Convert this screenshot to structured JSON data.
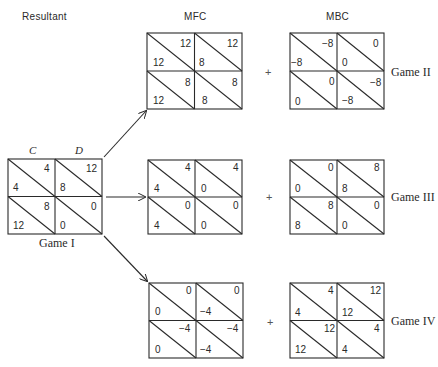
{
  "headers": {
    "resultant": "Resultant",
    "mfc": "MFC",
    "mbc": "MBC"
  },
  "strategy_labels": {
    "c": "C",
    "d": "D"
  },
  "plus_sign": "+",
  "games": {
    "game1": {
      "label": "Game I",
      "cells": [
        {
          "row": "C",
          "col": "C",
          "top_right": "4",
          "bottom_left": "4"
        },
        {
          "row": "C",
          "col": "D",
          "top_right": "12",
          "bottom_left": "8"
        },
        {
          "row": "D",
          "col": "C",
          "top_right": "8",
          "bottom_left": "12"
        },
        {
          "row": "D",
          "col": "D",
          "top_right": "0",
          "bottom_left": "0"
        }
      ]
    },
    "game2": {
      "label": "Game II",
      "mfc": [
        {
          "top_right": "12",
          "bottom_left": "12"
        },
        {
          "top_right": "12",
          "bottom_left": "8"
        },
        {
          "top_right": "8",
          "bottom_left": "12"
        },
        {
          "top_right": "8",
          "bottom_left": "8"
        }
      ],
      "mbc": [
        {
          "top_right": "−8",
          "bottom_left": "−8"
        },
        {
          "top_right": "0",
          "bottom_left": "0"
        },
        {
          "top_right": "0",
          "bottom_left": "0"
        },
        {
          "top_right": "−8",
          "bottom_left": "−8"
        }
      ]
    },
    "game3": {
      "label": "Game III",
      "mfc": [
        {
          "top_right": "4",
          "bottom_left": "4"
        },
        {
          "top_right": "4",
          "bottom_left": "0"
        },
        {
          "top_right": "0",
          "bottom_left": "4"
        },
        {
          "top_right": "0",
          "bottom_left": "0"
        }
      ],
      "mbc": [
        {
          "top_right": "0",
          "bottom_left": "0"
        },
        {
          "top_right": "8",
          "bottom_left": "8"
        },
        {
          "top_right": "8",
          "bottom_left": "8"
        },
        {
          "top_right": "0",
          "bottom_left": "0"
        }
      ]
    },
    "game4": {
      "label": "Game IV",
      "mfc": [
        {
          "top_right": "0",
          "bottom_left": "0"
        },
        {
          "top_right": "0",
          "bottom_left": "−4"
        },
        {
          "top_right": "−4",
          "bottom_left": "0"
        },
        {
          "top_right": "−4",
          "bottom_left": "−4"
        }
      ],
      "mbc": [
        {
          "top_right": "4",
          "bottom_left": "4"
        },
        {
          "top_right": "12",
          "bottom_left": "12"
        },
        {
          "top_right": "12",
          "bottom_left": "12"
        },
        {
          "top_right": "4",
          "bottom_left": "4"
        }
      ]
    }
  },
  "colors": {
    "line": "#2a2a2a",
    "text": "#2a2a2a"
  }
}
